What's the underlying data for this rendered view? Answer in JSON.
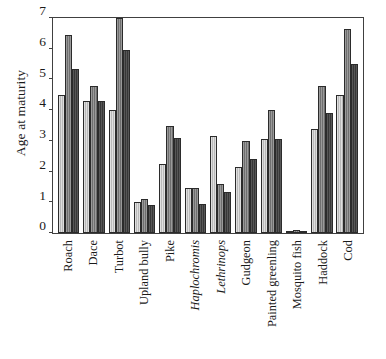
{
  "chart_data": {
    "type": "bar",
    "title": "",
    "xlabel": "",
    "ylabel": "Age at maturity",
    "ylim": [
      0,
      7
    ],
    "yticks": [
      0,
      1,
      2,
      3,
      4,
      5,
      6,
      7
    ],
    "ytick_labels": [
      "0",
      "1",
      "2",
      "3",
      "4",
      "5",
      "6",
      "7"
    ],
    "grid": false,
    "legend": "none",
    "categories": [
      "Roach",
      "Dace",
      "Turbot",
      "Upland bully",
      "Pike",
      "Haplochromis",
      "Lethrinops",
      "Gudgeon",
      "Painted greenling",
      "Mosquito fish",
      "Haddock",
      "Cod"
    ],
    "categories_italic": [
      false,
      false,
      false,
      false,
      false,
      true,
      true,
      false,
      false,
      false,
      false,
      false
    ],
    "series": [
      {
        "name": "series-1",
        "color": "#b9b9b9",
        "values": [
          4.5,
          4.3,
          4.0,
          1.0,
          2.25,
          1.45,
          3.15,
          2.15,
          3.05,
          0.08,
          3.4,
          4.5
        ]
      },
      {
        "name": "series-2",
        "color": "#6f6f6f",
        "values": [
          6.45,
          4.8,
          7.0,
          1.1,
          3.5,
          1.45,
          1.6,
          3.0,
          4.0,
          0.1,
          4.8,
          6.65
        ]
      },
      {
        "name": "series-3",
        "color": "#373737",
        "values": [
          5.35,
          4.3,
          5.95,
          0.9,
          3.1,
          0.95,
          1.35,
          2.4,
          3.05,
          0.07,
          3.9,
          5.5
        ]
      }
    ]
  }
}
